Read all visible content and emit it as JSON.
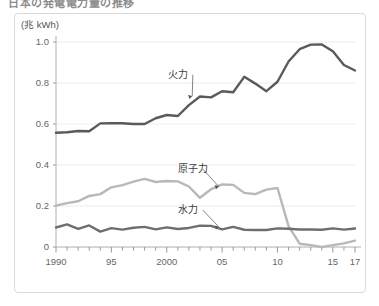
{
  "page": {
    "title": "日本の発電電力量の推移",
    "background_color": "#ffffff",
    "frame_border_color": "#d9d9d9"
  },
  "chart_data": {
    "type": "line",
    "title": "日本の発電電力量の推移",
    "unit_label": "(兆 kWh)",
    "xlabel": "",
    "ylabel": "",
    "grid": true,
    "legend_position": "inline-annotations",
    "xlim": [
      1990,
      2017
    ],
    "ylim": [
      0,
      1.0
    ],
    "ytick_labels": [
      "0",
      "0.2",
      "0.4",
      "0.6",
      "0.8",
      "1.0"
    ],
    "ytick_values": [
      0,
      0.2,
      0.4,
      0.6,
      0.8,
      1.0
    ],
    "xtick_labels": [
      "1990",
      "95",
      "2000",
      "05",
      "10",
      "15",
      "17"
    ],
    "xtick_values": [
      1990,
      1995,
      2000,
      2005,
      2010,
      2015,
      2017
    ],
    "x": [
      1990,
      1991,
      1992,
      1993,
      1994,
      1995,
      1996,
      1997,
      1998,
      1999,
      2000,
      2001,
      2002,
      2003,
      2004,
      2005,
      2006,
      2007,
      2008,
      2009,
      2010,
      2011,
      2012,
      2013,
      2014,
      2015,
      2016,
      2017
    ],
    "series": [
      {
        "name": "火力",
        "label": "火力",
        "color": "#5a5a5a",
        "width": 2.4,
        "label_x": 2000.1,
        "label_y": 0.845,
        "anchor_x": 2002.3,
        "anchor_y": 0.735,
        "values": [
          0.557,
          0.56,
          0.566,
          0.565,
          0.603,
          0.604,
          0.604,
          0.6,
          0.6,
          0.628,
          0.644,
          0.639,
          0.692,
          0.734,
          0.73,
          0.76,
          0.755,
          0.83,
          0.797,
          0.76,
          0.806,
          0.905,
          0.965,
          0.987,
          0.988,
          0.955,
          0.888,
          0.861
        ]
      },
      {
        "name": "原子力",
        "label": "原子力",
        "color": "#b8b8b8",
        "width": 2.4,
        "label_x": 2001.0,
        "label_y": 0.385,
        "anchor_x": 2004.7,
        "anchor_y": 0.295,
        "values": [
          0.202,
          0.214,
          0.223,
          0.249,
          0.258,
          0.291,
          0.302,
          0.319,
          0.332,
          0.317,
          0.322,
          0.32,
          0.295,
          0.24,
          0.282,
          0.305,
          0.303,
          0.264,
          0.258,
          0.28,
          0.288,
          0.102,
          0.016,
          0.009,
          0.0,
          0.009,
          0.018,
          0.031
        ]
      },
      {
        "name": "水力",
        "label": "水力",
        "color": "#6e6e6e",
        "width": 2.4,
        "label_x": 2001.0,
        "label_y": 0.185,
        "anchor_x": 2004.7,
        "anchor_y": 0.098,
        "values": [
          0.095,
          0.11,
          0.088,
          0.105,
          0.075,
          0.092,
          0.085,
          0.094,
          0.098,
          0.086,
          0.096,
          0.088,
          0.093,
          0.104,
          0.103,
          0.086,
          0.098,
          0.084,
          0.083,
          0.083,
          0.091,
          0.089,
          0.085,
          0.085,
          0.084,
          0.091,
          0.085,
          0.09
        ]
      }
    ]
  }
}
